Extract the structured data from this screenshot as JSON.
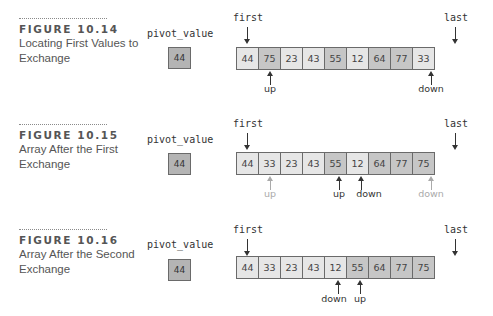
{
  "figures": [
    {
      "number": "FIGURE 10.14",
      "caption": "Locating First Values to Exchange",
      "pivot_label": "pivot_value",
      "pivot_value": "44",
      "first_label": "first",
      "last_label": "last",
      "cells": [
        {
          "value": "44",
          "shade": "light"
        },
        {
          "value": "75",
          "shade": "dark"
        },
        {
          "value": "23",
          "shade": "light"
        },
        {
          "value": "43",
          "shade": "light"
        },
        {
          "value": "55",
          "shade": "dark"
        },
        {
          "value": "12",
          "shade": "light"
        },
        {
          "value": "64",
          "shade": "dark"
        },
        {
          "value": "77",
          "shade": "dark"
        },
        {
          "value": "33",
          "shade": "light"
        }
      ],
      "pointers": [
        {
          "label": "up",
          "index": 1,
          "faded": false
        },
        {
          "label": "down",
          "index": 8,
          "faded": false
        }
      ]
    },
    {
      "number": "FIGURE 10.15",
      "caption": "Array After the First Exchange",
      "pivot_label": "pivot_value",
      "pivot_value": "44",
      "first_label": "first",
      "last_label": "last",
      "cells": [
        {
          "value": "44",
          "shade": "light"
        },
        {
          "value": "33",
          "shade": "light"
        },
        {
          "value": "23",
          "shade": "light"
        },
        {
          "value": "43",
          "shade": "light"
        },
        {
          "value": "55",
          "shade": "dark"
        },
        {
          "value": "12",
          "shade": "light"
        },
        {
          "value": "64",
          "shade": "dark"
        },
        {
          "value": "77",
          "shade": "dark"
        },
        {
          "value": "75",
          "shade": "dark"
        }
      ],
      "pointers": [
        {
          "label": "up",
          "index": 1,
          "faded": true
        },
        {
          "label": "up",
          "index": 4,
          "faded": false
        },
        {
          "label": "down",
          "index": 5,
          "faded": false
        },
        {
          "label": "down",
          "index": 8,
          "faded": true
        }
      ]
    },
    {
      "number": "FIGURE 10.16",
      "caption": "Array After the Second Exchange",
      "pivot_label": "pivot_value",
      "pivot_value": "44",
      "first_label": "first",
      "last_label": "last",
      "cells": [
        {
          "value": "44",
          "shade": "light"
        },
        {
          "value": "33",
          "shade": "light"
        },
        {
          "value": "23",
          "shade": "light"
        },
        {
          "value": "43",
          "shade": "light"
        },
        {
          "value": "12",
          "shade": "light"
        },
        {
          "value": "55",
          "shade": "dark"
        },
        {
          "value": "64",
          "shade": "dark"
        },
        {
          "value": "77",
          "shade": "dark"
        },
        {
          "value": "75",
          "shade": "dark"
        }
      ],
      "pointers": [
        {
          "label": "down",
          "index": 4,
          "faded": false
        },
        {
          "label": "up",
          "index": 5,
          "faded": false
        }
      ]
    }
  ],
  "colors": {
    "cell_light": "#e6e6e6",
    "cell_dark": "#c6c6c6",
    "pivot_fill": "#b4b4b4",
    "border": "#6a6a6a",
    "faded_pointer": "#aaaaaa"
  }
}
